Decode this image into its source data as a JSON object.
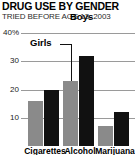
{
  "header": {
    "title": "DRUG USE BY GENDER",
    "subtitle": "TRIED BEFORE AGE 13: 2003"
  },
  "annotations": {
    "girls_label": "Girls",
    "boys_label": "Boys"
  },
  "axis": {
    "ticks": [
      "40%",
      "30",
      "20",
      "10"
    ]
  },
  "colors": {
    "girls": "#8a8a8a",
    "boys": "#111111",
    "gridline": "#9a9a9a",
    "background": "#ffffff"
  },
  "chart_data": {
    "type": "bar",
    "title": "DRUG USE BY GENDER",
    "subtitle": "TRIED BEFORE AGE 13: 2003",
    "xlabel": "",
    "ylabel": "",
    "ylim": [
      0,
      40
    ],
    "yticks": [
      10,
      20,
      30,
      40
    ],
    "ytick_labels": [
      "10",
      "20",
      "30",
      "40%"
    ],
    "grid": true,
    "legend": "inline-labels",
    "categories": [
      "Cigarettes",
      "Alcohol",
      "Marijuana"
    ],
    "series": [
      {
        "name": "Girls",
        "color": "#8a8a8a",
        "values": [
          16,
          23,
          7
        ]
      },
      {
        "name": "Boys",
        "color": "#111111",
        "values": [
          20,
          32,
          12
        ]
      }
    ]
  }
}
